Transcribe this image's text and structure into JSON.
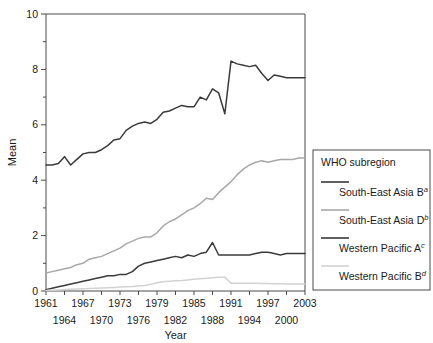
{
  "chart_data": {
    "type": "line",
    "title": "",
    "xlabel": "Year",
    "ylabel": "Mean",
    "xlim": [
      1961,
      2003
    ],
    "ylim": [
      0,
      10
    ],
    "ytick_values": [
      0,
      2,
      4,
      6,
      8,
      10
    ],
    "ytick_labels": [
      "0",
      "2",
      "4",
      "6",
      "8",
      "10"
    ],
    "yminor_step": 1,
    "xtick_values": [
      1961,
      1964,
      1967,
      1970,
      1973,
      1976,
      1979,
      1982,
      1985,
      1988,
      1991,
      1994,
      1997,
      2000,
      2003
    ],
    "xtick_labels_upper": [
      "1961",
      "1967",
      "1973",
      "1979",
      "1985",
      "1991",
      "1997",
      "2003"
    ],
    "xtick_labels_lower": [
      "1964",
      "1970",
      "1976",
      "1982",
      "1988",
      "1994",
      "2000"
    ],
    "grid": false,
    "legend_position": "right-outside",
    "legend_title": "WHO subregion",
    "x": [
      1961,
      1962,
      1963,
      1964,
      1965,
      1966,
      1967,
      1968,
      1969,
      1970,
      1971,
      1972,
      1973,
      1974,
      1975,
      1976,
      1977,
      1978,
      1979,
      1980,
      1981,
      1982,
      1983,
      1984,
      1985,
      1986,
      1987,
      1988,
      1989,
      1990,
      1991,
      1992,
      1993,
      1994,
      1995,
      1996,
      1997,
      1998,
      1999,
      2000,
      2001,
      2002,
      2003
    ],
    "series": [
      {
        "name": "South-East Asia B",
        "superscript": "a",
        "color": "#3a3a3a",
        "width": 1.5,
        "values": [
          4.55,
          4.55,
          4.6,
          4.85,
          4.55,
          4.75,
          4.95,
          5.0,
          5.0,
          5.1,
          5.25,
          5.45,
          5.5,
          5.8,
          5.95,
          6.05,
          6.1,
          6.05,
          6.2,
          6.45,
          6.5,
          6.6,
          6.7,
          6.65,
          6.65,
          7.0,
          6.9,
          7.3,
          7.15,
          6.4,
          8.3,
          8.2,
          8.15,
          8.1,
          8.15,
          7.85,
          7.6,
          7.8,
          7.75,
          7.7,
          7.7,
          7.7,
          7.7
        ]
      },
      {
        "name": "South-East Asia D",
        "superscript": "b",
        "color": "#a8a8a8",
        "width": 1.5,
        "values": [
          0.65,
          0.7,
          0.75,
          0.8,
          0.85,
          0.95,
          1.0,
          1.15,
          1.2,
          1.25,
          1.35,
          1.45,
          1.55,
          1.7,
          1.8,
          1.9,
          1.95,
          1.95,
          2.1,
          2.35,
          2.5,
          2.6,
          2.75,
          2.9,
          3.0,
          3.15,
          3.35,
          3.3,
          3.55,
          3.75,
          3.95,
          4.2,
          4.4,
          4.55,
          4.65,
          4.7,
          4.65,
          4.7,
          4.75,
          4.75,
          4.75,
          4.8,
          4.8
        ]
      },
      {
        "name": "Western Pacific A",
        "superscript": "c",
        "color": "#3a3a3a",
        "width": 1.5,
        "values": [
          0.05,
          0.1,
          0.15,
          0.2,
          0.25,
          0.3,
          0.35,
          0.4,
          0.45,
          0.5,
          0.55,
          0.55,
          0.6,
          0.6,
          0.7,
          0.9,
          1.0,
          1.05,
          1.1,
          1.15,
          1.2,
          1.25,
          1.2,
          1.3,
          1.25,
          1.35,
          1.4,
          1.75,
          1.3,
          1.3,
          1.3,
          1.3,
          1.3,
          1.3,
          1.35,
          1.4,
          1.4,
          1.35,
          1.3,
          1.35,
          1.35,
          1.35,
          1.35
        ]
      },
      {
        "name": "Western Pacific B",
        "superscript": "d",
        "color": "#d2d2d2",
        "width": 1.5,
        "values": [
          0.02,
          0.03,
          0.04,
          0.05,
          0.06,
          0.07,
          0.08,
          0.09,
          0.1,
          0.11,
          0.12,
          0.13,
          0.14,
          0.15,
          0.16,
          0.18,
          0.2,
          0.24,
          0.3,
          0.33,
          0.35,
          0.37,
          0.38,
          0.4,
          0.42,
          0.44,
          0.46,
          0.48,
          0.5,
          0.5,
          0.28,
          0.28,
          0.28,
          0.28,
          0.28,
          0.27,
          0.27,
          0.26,
          0.26,
          0.25,
          0.25,
          0.25,
          0.25
        ]
      }
    ]
  },
  "legend": {
    "title": "WHO subregion",
    "items": [
      {
        "label": "South-East Asia B",
        "superscript": "a",
        "color": "#3a3a3a"
      },
      {
        "label": "South-East Asia D",
        "superscript": "b",
        "color": "#a8a8a8"
      },
      {
        "label": "Western Pacific A",
        "superscript": "c",
        "color": "#3a3a3a"
      },
      {
        "label": "Western Pacific B",
        "superscript": "d",
        "color": "#d2d2d2"
      }
    ]
  }
}
